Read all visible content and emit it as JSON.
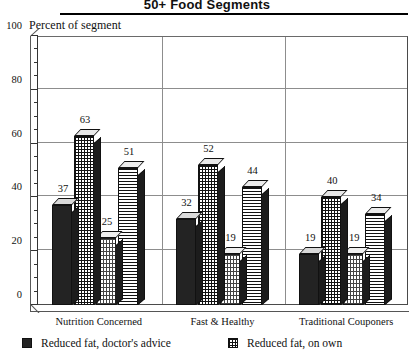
{
  "chart": {
    "title": "50+ Food Segments",
    "axis_caption": "Percent of segment"
  },
  "chart_data": {
    "type": "bar",
    "title": "50+ Food Segments",
    "xlabel": "",
    "ylabel": "Percent of segment",
    "ylim": [
      0,
      100
    ],
    "yticks": [
      0,
      20,
      40,
      60,
      80,
      100
    ],
    "ytick_labels": [
      "0",
      "20",
      "40",
      "60",
      "80",
      "100"
    ],
    "minor_tick_step": 5,
    "grid": "horizontal-and-group-dividers",
    "legend_position": "bottom",
    "categories": [
      "Nutrition Concerned",
      "Fast & Healthy",
      "Traditional Couponers"
    ],
    "series": [
      {
        "name": "Reduced fat, doctor's advice",
        "pattern": "solid-dark",
        "values": [
          37,
          32,
          19
        ]
      },
      {
        "name": "Reduced fat, on own",
        "pattern": "cross-hatch-grid",
        "values": [
          63,
          52,
          40
        ]
      },
      {
        "name": "",
        "pattern": "light-stipple",
        "values": [
          25,
          19,
          19
        ]
      },
      {
        "name": "",
        "pattern": "horizontal-lines",
        "values": [
          51,
          44,
          34
        ]
      }
    ],
    "bar_labels": [
      [
        37,
        63,
        25,
        51
      ],
      [
        32,
        52,
        19,
        44
      ],
      [
        19,
        40,
        19,
        34
      ]
    ]
  },
  "legend": {
    "items": [
      {
        "label": "Reduced fat, doctor's advice",
        "swatch": "solid-dark"
      },
      {
        "label": "Reduced fat, on own",
        "swatch": "cross-hatch-grid"
      }
    ]
  }
}
